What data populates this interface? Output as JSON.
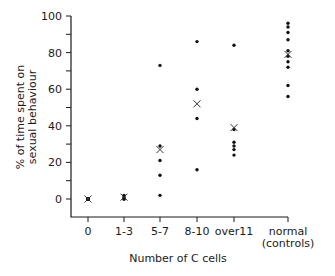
{
  "chart_data": {
    "type": "scatter",
    "title": "",
    "xlabel": "Number of C cells",
    "ylabel_lines": [
      "% of time spent on",
      "sexual behaviour"
    ],
    "ylim": [
      0,
      100
    ],
    "yticks_labeled": [
      0,
      20,
      40,
      60,
      80,
      100
    ],
    "yticks_minor_step": 10,
    "grid": false,
    "legend": "none",
    "categories": [
      {
        "label": [
          "0"
        ],
        "points": [
          0,
          0,
          0,
          0,
          0
        ],
        "mean": 0
      },
      {
        "label": [
          "1-3"
        ],
        "points": [
          0,
          0,
          1,
          2
        ],
        "mean": 1
      },
      {
        "label": [
          "5-7"
        ],
        "points": [
          73,
          29,
          21,
          13,
          2
        ],
        "mean": 27
      },
      {
        "label": [
          "8-10"
        ],
        "points": [
          86,
          60,
          44,
          16
        ],
        "mean": 52
      },
      {
        "label": [
          "over11"
        ],
        "points": [
          84,
          38,
          31,
          29,
          27,
          24
        ],
        "mean": 39
      },
      {
        "label": [
          "normal",
          "(controls)"
        ],
        "points": [
          96,
          94,
          91,
          87,
          81,
          78,
          75,
          72,
          62,
          56
        ],
        "mean": 79
      }
    ],
    "marker_legend": {
      "point": "individual animal (dot)",
      "mean": "mean (x)"
    }
  }
}
